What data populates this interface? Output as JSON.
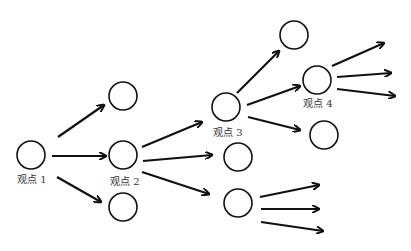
{
  "diagram": {
    "type": "viewpoint-tree",
    "labels": {
      "n1": "观点 1",
      "n2": "观点 2",
      "n3": "观点 3",
      "n4": "观点 4"
    },
    "nodes": [
      {
        "id": "n1",
        "x": 31,
        "y": 155,
        "label": "观点 1"
      },
      {
        "id": "a",
        "x": 123,
        "y": 96,
        "label": ""
      },
      {
        "id": "n2",
        "x": 123,
        "y": 155,
        "label": "观点 2"
      },
      {
        "id": "b",
        "x": 123,
        "y": 207,
        "label": ""
      },
      {
        "id": "n3",
        "x": 226,
        "y": 107,
        "label": "观点 3"
      },
      {
        "id": "c",
        "x": 238,
        "y": 157,
        "label": ""
      },
      {
        "id": "d",
        "x": 238,
        "y": 203,
        "label": ""
      },
      {
        "id": "e",
        "x": 294,
        "y": 35,
        "label": ""
      },
      {
        "id": "n4",
        "x": 317,
        "y": 80,
        "label": "观点 4"
      },
      {
        "id": "f",
        "x": 324,
        "y": 135,
        "label": ""
      }
    ],
    "edges": [
      [
        "n1",
        "a"
      ],
      [
        "n1",
        "n2"
      ],
      [
        "n1",
        "b"
      ],
      [
        "n2",
        "n3"
      ],
      [
        "n2",
        "c"
      ],
      [
        "n2",
        "d"
      ],
      [
        "n3",
        "e"
      ],
      [
        "n3",
        "n4"
      ],
      [
        "n3",
        "f"
      ]
    ],
    "open_arrows_from": {
      "n4": 3,
      "d": 3
    },
    "stroke_color": "#111111"
  }
}
